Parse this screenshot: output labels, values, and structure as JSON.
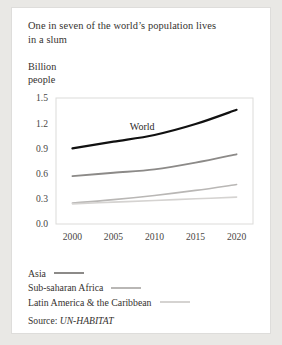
{
  "card": {
    "title_line1": "One in seven of the world’s population lives",
    "title_line2": "in a slum",
    "axis_label_line1": "Billion",
    "axis_label_line2": "people"
  },
  "legend": {
    "items": [
      {
        "label": "Asia",
        "color": "#8c8a88"
      },
      {
        "label": "Sub-saharan Africa",
        "color": "#b9b7b5"
      },
      {
        "label": "Latin America & the Caribbean",
        "color": "#d5d3d1"
      }
    ]
  },
  "source": {
    "prefix": "Source:",
    "name": "UN-HABITAT"
  },
  "chart_data": {
    "type": "line",
    "title": "One in seven of the world’s population lives in a slum",
    "xlabel": "",
    "ylabel": "Billion people",
    "x": [
      2000,
      2005,
      2010,
      2015,
      2020
    ],
    "xticklabels": [
      "2000",
      "2005",
      "2010",
      "2015",
      "2020"
    ],
    "yticklabels": [
      "0.0",
      "0.3",
      "0.6",
      "0.9",
      "1.2",
      "1.5"
    ],
    "yticks": [
      0.0,
      0.3,
      0.6,
      0.9,
      1.2,
      1.5
    ],
    "xlim": [
      1998,
      2022
    ],
    "ylim": [
      0.0,
      1.5
    ],
    "grid": false,
    "legend_position": "below-plot",
    "annotations": [
      {
        "text": "World",
        "x": 2008.5,
        "y": 1.12
      }
    ],
    "series": [
      {
        "name": "World",
        "color": "#111111",
        "width": 2.2,
        "values": [
          0.9,
          0.98,
          1.06,
          1.19,
          1.36
        ]
      },
      {
        "name": "Asia",
        "color": "#8c8a88",
        "width": 1.8,
        "values": [
          0.57,
          0.61,
          0.65,
          0.73,
          0.83
        ]
      },
      {
        "name": "Sub-saharan Africa",
        "color": "#b9b7b5",
        "width": 1.6,
        "values": [
          0.25,
          0.29,
          0.34,
          0.4,
          0.47
        ]
      },
      {
        "name": "Latin America & the Caribbean",
        "color": "#d5d3d1",
        "width": 1.6,
        "values": [
          0.24,
          0.26,
          0.28,
          0.3,
          0.32
        ]
      }
    ]
  }
}
